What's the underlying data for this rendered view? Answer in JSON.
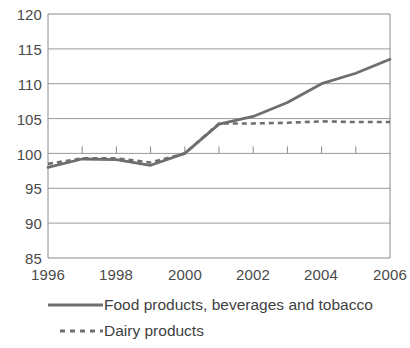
{
  "chart_data": {
    "type": "line",
    "title": "",
    "subtitle": "",
    "xlabel": "",
    "ylabel": "",
    "x": [
      1996,
      1997,
      1998,
      1999,
      2000,
      2001,
      2002,
      2003,
      2004,
      2005,
      2006
    ],
    "xlim": [
      1996,
      2006
    ],
    "ylim": [
      85,
      120
    ],
    "yticks": [
      85,
      90,
      95,
      100,
      105,
      110,
      115,
      120
    ],
    "ytick_labels": [
      "85",
      "90",
      "95",
      "100",
      "105",
      "110",
      "115",
      "120"
    ],
    "xticks": [
      1996,
      1998,
      2000,
      2002,
      2004,
      2006
    ],
    "xtick_labels": [
      "1996",
      "1998",
      "2000",
      "2002",
      "2004",
      "2006"
    ],
    "grid": true,
    "grid_axis": "y",
    "legend_position": "bottom-left",
    "series": [
      {
        "name": "Food products, beverages and tobacco",
        "style": "solid",
        "color": "#6e6e6e",
        "values": [
          98.0,
          99.2,
          99.1,
          98.3,
          100.0,
          104.2,
          105.3,
          107.3,
          110.0,
          111.5,
          113.5
        ]
      },
      {
        "name": "Dairy products",
        "style": "dashed",
        "color": "#6e6e6e",
        "values": [
          98.5,
          99.3,
          99.3,
          98.7,
          100.0,
          104.3,
          104.3,
          104.4,
          104.6,
          104.5,
          104.5
        ]
      }
    ]
  },
  "axes": {
    "y_tick_labels": [
      "120",
      "115",
      "110",
      "105",
      "100",
      "95",
      "90",
      "85"
    ],
    "x_tick_labels": [
      "1996",
      "1998",
      "2000",
      "2002",
      "2004",
      "2006"
    ]
  },
  "legend": {
    "items": [
      {
        "label": "Food products, beverages and tobacco",
        "style": "solid"
      },
      {
        "label": "Dairy products",
        "style": "dashed"
      }
    ]
  },
  "colors": {
    "line": "#6e6e6e",
    "grid": "#9a9a9a",
    "frame": "#8c8c8c",
    "text": "#444444",
    "background": "#ffffff"
  }
}
